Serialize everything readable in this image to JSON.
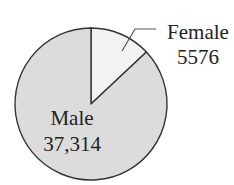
{
  "chart_data": {
    "type": "pie",
    "title": "",
    "categories": [
      "Female",
      "Male"
    ],
    "values": [
      5576,
      37314
    ],
    "value_labels": [
      "5576",
      "37,314"
    ],
    "colors": [
      "#f2f2f2",
      "#dcdcdc"
    ],
    "start_angle_deg_from_top": 0,
    "direction": "clockwise",
    "legend": "none",
    "labels": {
      "female": {
        "name": "Female",
        "value": "5576",
        "position": "outside-right",
        "leader_line": true
      },
      "male": {
        "name": "Male",
        "value": "37,314",
        "position": "inside"
      }
    }
  },
  "style": {
    "outline_color": "#333333",
    "background": "#ffffff"
  }
}
